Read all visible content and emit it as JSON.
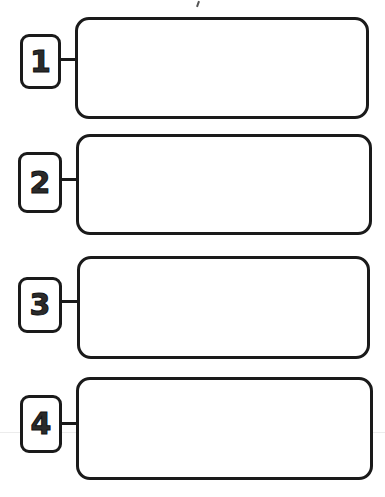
{
  "diagram": {
    "type": "numbered-steps-template",
    "stroke_color": "#1a1a1a",
    "background": "#ffffff",
    "steps": [
      {
        "number": "1",
        "content": ""
      },
      {
        "number": "2",
        "content": ""
      },
      {
        "number": "3",
        "content": ""
      },
      {
        "number": "4",
        "content": ""
      }
    ]
  }
}
